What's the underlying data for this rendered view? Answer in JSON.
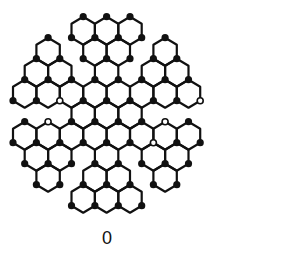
{
  "diagram": {
    "type": "hexagonal lattice (snowflake-shaped graphene-like cluster)",
    "caption": "0",
    "colors": {
      "background": "#ffffff",
      "stroke": "#111111",
      "dot": "#111111",
      "hollow_fill": "#ffffff"
    },
    "geometry": {
      "origin_x": 24.7,
      "half_step_x": 11.7,
      "origin_y": 30.7,
      "row_step_y": 21,
      "half_width": 11.7,
      "radius": 14,
      "stroke_width": 2.2,
      "dot_radius": 3.6
    },
    "hex_rows": [
      {
        "row": 0,
        "cols": [
          5,
          7,
          9
        ]
      },
      {
        "row": 1,
        "cols": [
          2,
          6,
          8,
          12
        ]
      },
      {
        "row": 2,
        "cols": [
          1,
          3,
          7,
          11,
          13
        ]
      },
      {
        "row": 3,
        "cols": [
          0,
          2,
          4,
          6,
          8,
          10,
          12,
          14
        ]
      },
      {
        "row": 4,
        "cols": [
          5,
          7,
          9
        ]
      },
      {
        "row": 5,
        "cols": [
          0,
          2,
          4,
          6,
          8,
          10,
          12,
          14
        ]
      },
      {
        "row": 6,
        "cols": [
          1,
          3,
          7,
          11,
          13
        ]
      },
      {
        "row": 7,
        "cols": [
          2,
          6,
          8,
          12
        ]
      },
      {
        "row": 8,
        "cols": [
          5,
          7,
          9
        ]
      }
    ],
    "hollow_dots": [
      [
        58,
        100
      ],
      [
        47,
        122
      ],
      [
        198,
        100
      ],
      [
        163,
        122
      ],
      [
        152,
        145
      ]
    ]
  }
}
